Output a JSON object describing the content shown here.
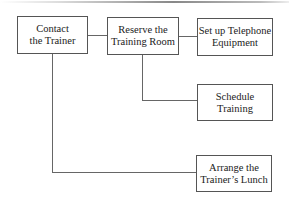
{
  "diagram": {
    "type": "hierarchy-tree",
    "nodes": [
      {
        "id": "contact",
        "label_line1": "Contact",
        "label_line2": "the Trainer"
      },
      {
        "id": "reserve",
        "label_line1": "Reserve the",
        "label_line2": "Training Room"
      },
      {
        "id": "telephone",
        "label_line1": "Set up Telephone",
        "label_line2": "Equipment"
      },
      {
        "id": "schedule",
        "label_line1": "Schedule",
        "label_line2": "Training"
      },
      {
        "id": "lunch",
        "label_line1": "Arrange the",
        "label_line2": "Trainer’s Lunch"
      }
    ],
    "edges": [
      {
        "from": "contact",
        "to": "reserve"
      },
      {
        "from": "reserve",
        "to": "telephone"
      },
      {
        "from": "reserve",
        "to": "schedule"
      },
      {
        "from": "contact",
        "to": "lunch"
      }
    ]
  }
}
